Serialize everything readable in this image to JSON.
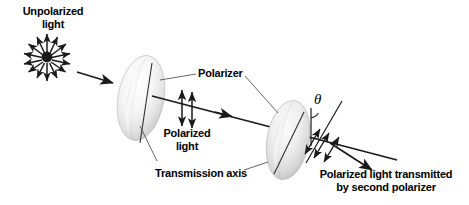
{
  "figure": {
    "name": "polarization-of-light-diagram",
    "background": "#ffffff",
    "width": 469,
    "height": 205
  },
  "labels": {
    "unpolarized_line1": "Unpolarized",
    "unpolarized_line2": "light",
    "polarizer": "Polarizer",
    "polarized_line1": "Polarized",
    "polarized_line2": "light",
    "transmission_axis": "Transmission axis",
    "transmitted_line1": "Polarized light transmitted",
    "transmitted_line2": "by second polarizer",
    "theta": "θ"
  },
  "colors": {
    "stroke": "#1a1a1a",
    "text": "#000000",
    "disc_light": "#fdfdfd",
    "disc_mid": "#e8e8e8",
    "disc_shadow": "#c9c9c9",
    "axis_line": "#3a3a3a"
  },
  "elements": {
    "unpolarized_burst_rays": 16,
    "polarized_arrow_count": 2,
    "transmitted_arrow_count": 3,
    "polarizer_count": 2
  }
}
